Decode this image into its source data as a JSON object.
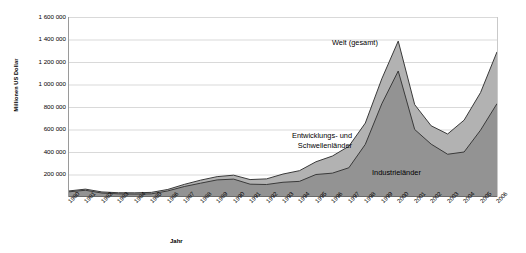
{
  "chart_data": {
    "type": "area",
    "stacked": true,
    "title": "",
    "xlabel": "Jahr",
    "ylabel": "Millionen US Dollar",
    "ylim": [
      0,
      1600000
    ],
    "ytick_step": 200000,
    "ytick_labels": [
      "1 600 000",
      "1 400 000",
      "1 200 000",
      "1 000 000",
      "800 000",
      "600 000",
      "400 000",
      "200 000",
      "0"
    ],
    "ytick_values": [
      1600000,
      1400000,
      1200000,
      1000000,
      800000,
      600000,
      400000,
      200000,
      0
    ],
    "grid": true,
    "grid_axis": "y",
    "legend_position": "inline-annotations",
    "categories": [
      "1980",
      "1981",
      "1982",
      "1983",
      "1984",
      "1985",
      "1986",
      "1987",
      "1988",
      "1989",
      "1990",
      "1991",
      "1992",
      "1993",
      "1994",
      "1995",
      "1996",
      "1997",
      "1998",
      "1999",
      "2000",
      "2001",
      "2002",
      "2003",
      "2004",
      "2005",
      "2006"
    ],
    "series": [
      {
        "name": "Industrieländer",
        "color": "#939393",
        "values": [
          46000,
          60000,
          35000,
          28000,
          26000,
          28000,
          54000,
          93000,
          123000,
          152000,
          159000,
          114000,
          111000,
          131000,
          139000,
          200000,
          212000,
          260000,
          468000,
          828000,
          1120000,
          600000,
          470000,
          380000,
          400000,
          594000,
          830000
        ]
      },
      {
        "name": "Entwicklungs- und Schwellenländer",
        "color": "#b2b2b2",
        "values": [
          8000,
          10000,
          10000,
          10000,
          11000,
          13000,
          13000,
          19000,
          27000,
          29000,
          35000,
          41000,
          50000,
          73000,
          95000,
          113000,
          152000,
          191000,
          189000,
          222000,
          266000,
          221000,
          163000,
          180000,
          283000,
          334000,
          460000
        ]
      }
    ],
    "total_series": {
      "name": "Welt (gesamt)",
      "values": [
        54000,
        70000,
        45000,
        38000,
        37000,
        41000,
        67000,
        112000,
        150000,
        181000,
        194000,
        155000,
        161000,
        204000,
        234000,
        313000,
        364000,
        451000,
        657000,
        1050000,
        1386000,
        821000,
        633000,
        560000,
        683000,
        928000,
        1290000
      ]
    },
    "annotations": [
      {
        "id": "welt",
        "text": "Welt (gesamt)"
      },
      {
        "id": "entwicklungs",
        "line1": "Entwicklungs- und",
        "line2": "Schwellenländer"
      },
      {
        "id": "industrie",
        "text": "Industrieländer"
      }
    ]
  },
  "colors": {
    "developing_area": "#b2b2b2",
    "industrial_area": "#939393",
    "line_stroke": "#3a3a3a",
    "grid": "#d9d9d9",
    "axis": "#9a9a9a",
    "background": "#ffffff",
    "text": "#000000"
  }
}
